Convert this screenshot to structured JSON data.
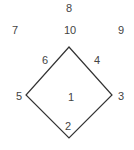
{
  "diagram": {
    "title": "",
    "type": "baseball-field-positions",
    "line_color": "#333333",
    "text_color": "#444444",
    "diamond": {
      "vertices": {
        "top": [
          69,
          47
        ],
        "right": [
          112,
          95
        ],
        "bottom": [
          69,
          138
        ],
        "left": [
          26,
          95
        ]
      }
    },
    "labels": [
      {
        "text": "8",
        "x": 69,
        "y": 8
      },
      {
        "text": "7",
        "x": 15,
        "y": 30
      },
      {
        "text": "10",
        "x": 70,
        "y": 30
      },
      {
        "text": "9",
        "x": 121,
        "y": 30
      },
      {
        "text": "6",
        "x": 45,
        "y": 60
      },
      {
        "text": "4",
        "x": 97,
        "y": 60
      },
      {
        "text": "5",
        "x": 19,
        "y": 96
      },
      {
        "text": "1",
        "x": 71,
        "y": 97
      },
      {
        "text": "3",
        "x": 121,
        "y": 96
      },
      {
        "text": "2",
        "x": 68,
        "y": 126
      }
    ]
  }
}
